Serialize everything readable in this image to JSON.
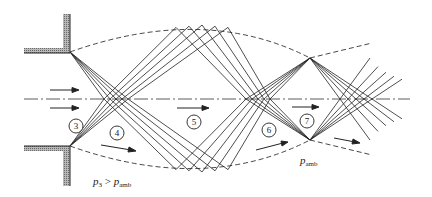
{
  "diagram": {
    "type": "underexpanded-jet-shock-diamond",
    "regions": [
      {
        "id": "region-3",
        "label": "3"
      },
      {
        "id": "region-4",
        "label": "4"
      },
      {
        "id": "region-5",
        "label": "5"
      },
      {
        "id": "region-6",
        "label": "6"
      },
      {
        "id": "region-7",
        "label": "7"
      }
    ],
    "labels": {
      "pressure_condition": {
        "p": "p",
        "sub1": "3",
        "op": " > ",
        "p2": "p",
        "sub2": "amb"
      },
      "ambient_pressure": {
        "p": "p",
        "sub": "amb"
      }
    },
    "colors": {
      "line": "#222222",
      "wall_fill": "#9a9a9a",
      "background": "#ffffff"
    }
  }
}
